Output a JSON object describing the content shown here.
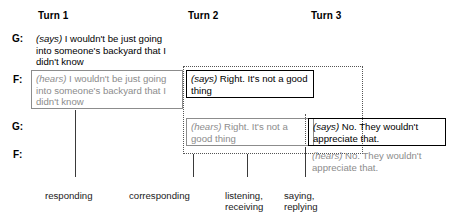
{
  "columns": [
    {
      "label": "Turn 1"
    },
    {
      "label": "Turn 2"
    },
    {
      "label": "Turn 3"
    }
  ],
  "rows": [
    {
      "speaker": "G:"
    },
    {
      "speaker": "F:"
    },
    {
      "speaker": "G:"
    },
    {
      "speaker": "F:"
    }
  ],
  "utterances": {
    "g1_says": {
      "mode": "(says)",
      "text": " I wouldn't be just going into someone's backyard that I didn't know"
    },
    "f1_hears": {
      "mode": "(hears)",
      "text": " I wouldn't be just going into someone's backyard that I didn't know"
    },
    "f2_says": {
      "mode": "(says)",
      "text": " Right. It's not a good thing"
    },
    "g2_hears": {
      "mode": "(hears)",
      "text": " Right. It's not a good thing"
    },
    "g3_says": {
      "mode": "(says)",
      "text": " No. They wouldn't appreciate that."
    },
    "f3_hears": {
      "mode": "(hears)",
      "text": " No. They wouldn't appreciate that."
    }
  },
  "captions": [
    {
      "label": "responding"
    },
    {
      "label": "corresponding"
    },
    {
      "label": "listening,\nreceiving"
    },
    {
      "label": "saying,\nreplying"
    }
  ],
  "colors": {
    "says_text": "#000000",
    "hears_text": "#8c8c8c",
    "box_black": "#000000",
    "box_grey": "#8c8c8c",
    "dotted": "#555555",
    "leader": "#3a3a3a",
    "background": "#ffffff"
  }
}
